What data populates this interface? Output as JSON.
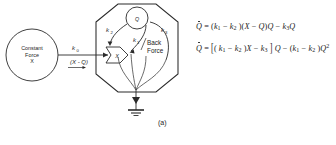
{
  "figure": {
    "panel_label": "(a)",
    "background_color": "#ffffff",
    "ink_color": "#1d1d1d"
  },
  "diagram": {
    "source_node": {
      "name": "constant-force-source",
      "line1": "Constant",
      "line2": "Force",
      "line3": "X"
    },
    "compartment": {
      "name": "system-boundary-hexagon",
      "shape": "hexagon"
    },
    "state_node": {
      "name": "quantity-node",
      "label": "Q",
      "shape": "circle"
    },
    "gate_node": {
      "name": "force-gate",
      "label": "X",
      "shape": "pentagon-arrow"
    },
    "input_flow": {
      "rate_symbol": "k",
      "rate_subscript": "0",
      "expression": "(X - Q)"
    },
    "rates": [
      {
        "name": "rate-k1",
        "symbol": "k",
        "subscript": "1"
      },
      {
        "name": "rate-k2",
        "symbol": "k",
        "subscript": "2"
      },
      {
        "name": "rate-k3",
        "symbol": "k",
        "subscript": "3"
      }
    ],
    "back_force": {
      "line1": "Back",
      "line2": "Force"
    },
    "sink": {
      "name": "ground-sink",
      "label": ""
    }
  },
  "equations": [
    {
      "name": "rate-equation-1",
      "plain": "Q̇ = (k1 - k2)(X - Q)Q - k3Q"
    },
    {
      "name": "rate-equation-2",
      "plain": "Q̇ = [(k1 - k2)X - k3]Q - (k1 - k2)Q²"
    }
  ]
}
